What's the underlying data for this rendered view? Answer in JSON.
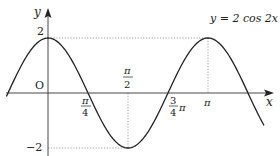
{
  "chart_data": {
    "type": "line",
    "title": "y = 2 cos 2x",
    "function": "2*cos(2*x)",
    "xlabel": "x",
    "ylabel": "y",
    "origin_label": "O",
    "x_range": [
      -0.26,
      1.35
    ],
    "x_range_units": "pi",
    "ylim": [
      -2,
      2
    ],
    "x_ticks": [
      {
        "value_pi": 0.25,
        "label_num": "π",
        "label_den": "4"
      },
      {
        "value_pi": 0.5,
        "label_num": "π",
        "label_den": "2"
      },
      {
        "value_pi": 0.75,
        "label_num": "3",
        "label_den": "4",
        "label_suffix": "π"
      },
      {
        "value_pi": 1.0,
        "label": "π"
      }
    ],
    "y_ticks": [
      {
        "value": 2,
        "label": "2"
      },
      {
        "value": -2,
        "label": "−2"
      }
    ],
    "guide_lines": "dotted lines at y=2 from axis to peak x=π, at y=-2 to trough x=π/2, and vertical dotted at x=π/2 and x=π",
    "grid": false,
    "legend": "none"
  },
  "labels": {
    "equation": "y = 2 cos 2x",
    "y_axis": "y",
    "x_axis": "x",
    "origin": "O",
    "y_max": "2",
    "y_min": "−2",
    "pi": "π",
    "four": "4",
    "two": "2",
    "three": "3"
  }
}
